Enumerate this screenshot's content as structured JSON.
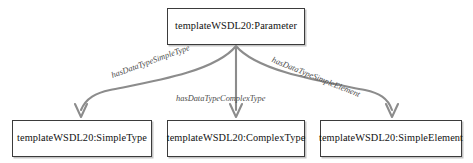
{
  "diagram": {
    "type": "node-edge-graph",
    "colors": {
      "background": "#ffffff",
      "node_border": "#3b3b3b",
      "node_fill": "#ffffff",
      "node_text": "#111111",
      "edge_stroke": "#8c8c8c",
      "edge_label_text": "#4c4c4c"
    },
    "nodes": [
      {
        "id": "parameter",
        "label": "templateWSDL20:Parameter",
        "role": "source"
      },
      {
        "id": "simpletype",
        "label": "templateWSDL20:SimpleType",
        "role": "target"
      },
      {
        "id": "complextype",
        "label": "templateWSDL20:ComplexType",
        "role": "target"
      },
      {
        "id": "simpleelement",
        "label": "templateWSDL20:SimpleElement",
        "role": "target"
      }
    ],
    "edges": [
      {
        "id": "edge-simpletype",
        "label": "hasDataTypeSimpleType",
        "from": "parameter",
        "to": "simpletype"
      },
      {
        "id": "edge-complextype",
        "label": "hasDataTypeComplexType",
        "from": "parameter",
        "to": "complextype"
      },
      {
        "id": "edge-simpleelement",
        "label": "hasDataTypeSimpleElement",
        "from": "parameter",
        "to": "simpleelement"
      }
    ]
  }
}
